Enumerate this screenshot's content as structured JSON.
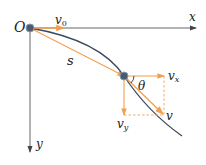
{
  "diagram": {
    "labels": {
      "origin": "O",
      "x_axis": "x",
      "y_axis": "y",
      "initial_velocity": "v",
      "initial_velocity_sub": "0",
      "displacement": "s",
      "angle": "θ",
      "vx": "v",
      "vx_sub": "x",
      "vy": "v",
      "vy_sub": "y",
      "v": "v"
    },
    "colors": {
      "axis": "#555555",
      "trajectory": "#3a4a5e",
      "vector": "#f0a050",
      "point": "#4a5a70"
    }
  }
}
